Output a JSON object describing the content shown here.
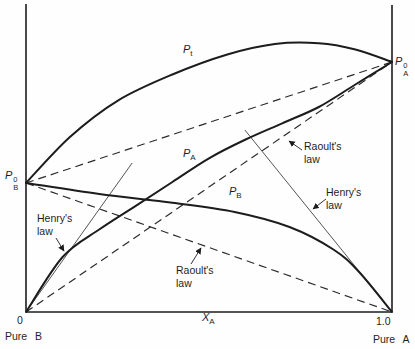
{
  "figure": {
    "background": "#fefefe",
    "ink": "#1c1c1c"
  },
  "chart_data": {
    "type": "line",
    "title": "",
    "xlabel": "X_A",
    "ylabel": "",
    "x_range": [
      0,
      1
    ],
    "x_tick_labels": [
      "0",
      "1.0"
    ],
    "x_end_captions": [
      "Pure B",
      "Pure A"
    ],
    "pressure_normalized_to_pA0": 1.0,
    "pB0": 0.516,
    "series": [
      {
        "name": "P_t",
        "label": "P_t",
        "style": "thick",
        "points": [
          [
            0,
            0.516
          ],
          [
            0.12,
            0.7
          ],
          [
            0.25,
            0.845
          ],
          [
            0.4,
            0.95
          ],
          [
            0.55,
            1.03
          ],
          [
            0.68,
            1.072
          ],
          [
            0.8,
            1.075
          ],
          [
            0.9,
            1.05
          ],
          [
            1.0,
            1.0
          ]
        ]
      },
      {
        "name": "P_A",
        "label": "P_A",
        "style": "thick",
        "points": [
          [
            0,
            0
          ],
          [
            0.1,
            0.22
          ],
          [
            0.2,
            0.33
          ],
          [
            0.3,
            0.425
          ],
          [
            0.4,
            0.52
          ],
          [
            0.5,
            0.615
          ],
          [
            0.6,
            0.69
          ],
          [
            0.7,
            0.755
          ],
          [
            0.8,
            0.82
          ],
          [
            0.9,
            0.91
          ],
          [
            1.0,
            1.0
          ]
        ]
      },
      {
        "name": "P_B",
        "label": "P_B",
        "style": "thick",
        "points": [
          [
            0,
            0.516
          ],
          [
            0.2,
            0.472
          ],
          [
            0.4,
            0.437
          ],
          [
            0.57,
            0.4
          ],
          [
            0.72,
            0.34
          ],
          [
            0.84,
            0.25
          ],
          [
            0.91,
            0.16
          ],
          [
            1.0,
            0
          ]
        ]
      }
    ],
    "reference_lines": [
      {
        "name": "ideal_total",
        "meaning": "ideal total pressure (P_B0 to P_A0)",
        "style": "dashed",
        "from": [
          0,
          0.516
        ],
        "to": [
          1,
          1.0
        ]
      },
      {
        "name": "raoult_A",
        "meaning": "Raoult's law for A",
        "style": "dashed",
        "from": [
          0,
          0
        ],
        "to": [
          1,
          1.0
        ]
      },
      {
        "name": "raoult_B",
        "meaning": "Raoult's law for B",
        "style": "dashed",
        "from": [
          0,
          0.516
        ],
        "to": [
          1,
          0
        ]
      },
      {
        "name": "henry_A",
        "meaning": "Henry's law tangent for A",
        "style": "thin",
        "from": [
          0,
          0
        ],
        "to": [
          0.29,
          0.596
        ]
      },
      {
        "name": "henry_B",
        "meaning": "Henry's law tangent for B",
        "style": "thin",
        "from": [
          1,
          0
        ],
        "to": [
          0.598,
          0.728
        ]
      }
    ],
    "plot_px": {
      "x0": 26,
      "x1": 392,
      "y_base": 312,
      "p_unit": 250
    }
  },
  "labels": {
    "p_total": {
      "main": "P",
      "sub": "t"
    },
    "p_a": {
      "main": "P",
      "sub": "A"
    },
    "p_b": {
      "main": "P",
      "sub": "B"
    },
    "p0_a": {
      "main": "P",
      "sup": "0",
      "sub": "A"
    },
    "p0_b": {
      "main": "P",
      "sup": "0",
      "sub": "B"
    },
    "x_axis": {
      "main": "X",
      "sub": "A"
    },
    "tick_zero": "0",
    "tick_one": "1.0",
    "pure_b": "Pure B",
    "pure_a": "Pure A"
  },
  "annotations": {
    "henry_left": {
      "line1": "Henry's",
      "line2": "law"
    },
    "raoult_bottom": {
      "line1": "Raoult's",
      "line2": "law"
    },
    "raoult_right": {
      "line1": "Raoult's",
      "line2": "law"
    },
    "henry_right": {
      "line1": "Henry's",
      "line2": "law"
    }
  }
}
